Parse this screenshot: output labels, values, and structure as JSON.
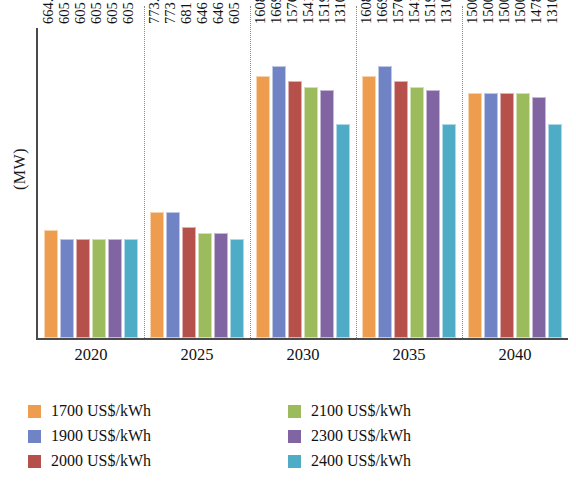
{
  "chart_data": {
    "type": "bar",
    "title": "",
    "subtitle": "",
    "xlabel": "",
    "ylabel": "(MW)",
    "categories": [
      "2020",
      "2025",
      "2030",
      "2035",
      "2040"
    ],
    "ylim": [
      0,
      1900
    ],
    "grid": false,
    "legend_position": "bottom",
    "group_separators": true,
    "series": [
      {
        "name": "1700 US$/kWh",
        "color": "#EE9C4D",
        "values": [
          664.28,
          773.09,
          1608.8,
          1608.8,
          1500
        ],
        "labels": [
          "664.28",
          "773.09",
          "1608.8",
          "1608.8",
          "1500"
        ]
      },
      {
        "name": "1900 US$/kWh",
        "color": "#7083C4",
        "values": [
          605,
          773,
          1669,
          1669,
          1500
        ],
        "labels": [
          "605",
          "773",
          "1669",
          "1669",
          "1500"
        ]
      },
      {
        "name": "2000 US$/kWh",
        "color": "#B5514A",
        "values": [
          605,
          681,
          1576,
          1576,
          1500
        ],
        "labels": [
          "605",
          "681",
          "1576",
          "1576",
          "1500"
        ]
      },
      {
        "name": "2100 US$/kWh",
        "color": "#9CBB5C",
        "values": [
          605,
          646,
          1541,
          1541,
          1500
        ],
        "labels": [
          "605",
          "646",
          "1541",
          "1541",
          "1500"
        ]
      },
      {
        "name": "2300 US$/kWh",
        "color": "#8165A3",
        "values": [
          605,
          646,
          1519,
          1519,
          1478
        ],
        "labels": [
          "605",
          "646",
          "1519",
          "1519",
          "1478"
        ]
      },
      {
        "name": "2400 US$/kWh",
        "color": "#4FACC7",
        "values": [
          605,
          605,
          1310,
          1310,
          1310
        ],
        "labels": [
          "605",
          "605",
          "1310",
          "1310",
          "1310"
        ]
      }
    ]
  },
  "axis": {
    "y_title": "(MW)"
  },
  "legend": {
    "column_left": [
      {
        "label": "1700 US$/kWh",
        "color": "#EE9C4D"
      },
      {
        "label": "1900 US$/kWh",
        "color": "#7083C4"
      },
      {
        "label": "2000 US$/kWh",
        "color": "#B5514A"
      }
    ],
    "column_right": [
      {
        "label": "2100 US$/kWh",
        "color": "#9CBB5C"
      },
      {
        "label": "2300 US$/kWh",
        "color": "#8165A3"
      },
      {
        "label": "2400 US$/kWh",
        "color": "#4FACC7"
      }
    ]
  }
}
